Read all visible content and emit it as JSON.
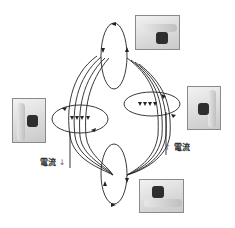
{
  "diagram": {
    "colors": {
      "line": "#222222",
      "photo_border": "#8a8a8a",
      "label": "#333333"
    }
  },
  "labels": {
    "current_left": "電流",
    "current_left_arrow": "↓",
    "current_right": "電流",
    "current_right_arrow": "↑"
  },
  "photos": [
    {
      "id": "top-right",
      "desc": "hand-photo-horizontal-thumb-right"
    },
    {
      "id": "left",
      "desc": "hand-photo-vertical-thumb-up"
    },
    {
      "id": "right",
      "desc": "hand-photo-vertical-thumb-up"
    },
    {
      "id": "bottom-right",
      "desc": "hand-photo-horizontal-thumb-right"
    }
  ]
}
